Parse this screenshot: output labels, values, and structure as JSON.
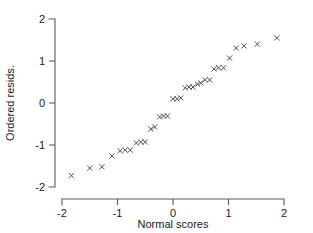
{
  "chart_data": {
    "type": "scatter",
    "title": "",
    "xlabel": "Normal scores",
    "ylabel": "Ordered resids.",
    "xlim": [
      -2,
      2
    ],
    "ylim": [
      -2,
      2
    ],
    "xticks": [
      -2,
      -1,
      0,
      1,
      2
    ],
    "yticks": [
      -2,
      -1,
      0,
      1,
      2
    ],
    "xtick_labels": [
      "-2",
      "-1",
      "0",
      "1",
      "2"
    ],
    "ytick_labels": [
      "-2",
      "-1",
      "0",
      "1",
      "2"
    ],
    "grid": false,
    "legend": null,
    "marker": "x",
    "marker_color": "#3c3c3c",
    "points": [
      {
        "x": -1.83,
        "y": -1.73
      },
      {
        "x": -1.5,
        "y": -1.55
      },
      {
        "x": -1.28,
        "y": -1.52
      },
      {
        "x": -1.1,
        "y": -1.26
      },
      {
        "x": -0.95,
        "y": -1.14
      },
      {
        "x": -0.86,
        "y": -1.12
      },
      {
        "x": -0.77,
        "y": -1.12
      },
      {
        "x": -0.66,
        "y": -0.95
      },
      {
        "x": -0.58,
        "y": -0.93
      },
      {
        "x": -0.5,
        "y": -0.93
      },
      {
        "x": -0.4,
        "y": -0.62
      },
      {
        "x": -0.33,
        "y": -0.57
      },
      {
        "x": -0.24,
        "y": -0.33
      },
      {
        "x": -0.17,
        "y": -0.31
      },
      {
        "x": -0.1,
        "y": -0.31
      },
      {
        "x": 0.0,
        "y": 0.1
      },
      {
        "x": 0.07,
        "y": 0.1
      },
      {
        "x": 0.14,
        "y": 0.12
      },
      {
        "x": 0.22,
        "y": 0.36
      },
      {
        "x": 0.29,
        "y": 0.38
      },
      {
        "x": 0.36,
        "y": 0.38
      },
      {
        "x": 0.44,
        "y": 0.45
      },
      {
        "x": 0.5,
        "y": 0.48
      },
      {
        "x": 0.58,
        "y": 0.55
      },
      {
        "x": 0.66,
        "y": 0.55
      },
      {
        "x": 0.74,
        "y": 0.81
      },
      {
        "x": 0.82,
        "y": 0.84
      },
      {
        "x": 0.91,
        "y": 0.84
      },
      {
        "x": 1.02,
        "y": 1.07
      },
      {
        "x": 1.14,
        "y": 1.31
      },
      {
        "x": 1.28,
        "y": 1.36
      },
      {
        "x": 1.52,
        "y": 1.4
      },
      {
        "x": 1.87,
        "y": 1.55
      }
    ]
  }
}
